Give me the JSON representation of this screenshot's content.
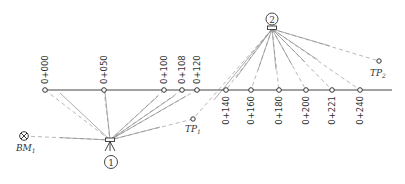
{
  "diagram": {
    "type": "leveling-survey-plan",
    "stations": [
      {
        "label": "0+000",
        "x": 45,
        "side": "top"
      },
      {
        "label": "0+050",
        "x": 104,
        "side": "top"
      },
      {
        "label": "0+100",
        "x": 164,
        "side": "top"
      },
      {
        "label": "0+108",
        "x": 182,
        "side": "top"
      },
      {
        "label": "0+120",
        "x": 197,
        "side": "top"
      },
      {
        "label": "0+140",
        "x": 226,
        "side": "bottom"
      },
      {
        "label": "0+160",
        "x": 251,
        "side": "bottom"
      },
      {
        "label": "0+180",
        "x": 279,
        "side": "bottom"
      },
      {
        "label": "0+200",
        "x": 306,
        "side": "bottom"
      },
      {
        "label": "0+221",
        "x": 332,
        "side": "bottom"
      },
      {
        "label": "0+240",
        "x": 360,
        "side": "bottom"
      }
    ],
    "instruments": [
      {
        "label": "1",
        "x": 110,
        "y": 140
      },
      {
        "label": "2",
        "x": 272,
        "y": 29
      }
    ],
    "benchmark": {
      "label": "BM",
      "sub": "1"
    },
    "turning_points": [
      {
        "label": "TP",
        "sub": "1"
      },
      {
        "label": "TP",
        "sub": "2"
      }
    ]
  }
}
